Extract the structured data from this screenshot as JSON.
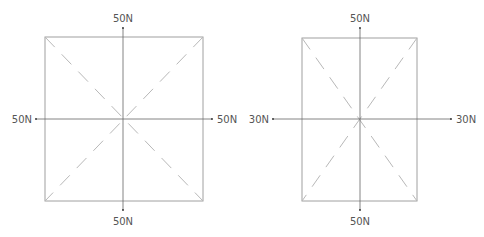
{
  "diagrams": [
    {
      "name": "square-plate",
      "box": {
        "x": 45,
        "y": 37,
        "w": 158,
        "h": 164
      },
      "center": {
        "x": 123,
        "y": 119
      },
      "forces": {
        "top": "50N",
        "bottom": "50N",
        "left": "50N",
        "right": "50N"
      }
    },
    {
      "name": "rectangular-plate",
      "box": {
        "x": 302,
        "y": 38,
        "w": 115,
        "h": 163
      },
      "center": {
        "x": 360,
        "y": 119
      },
      "forces": {
        "top": "50N",
        "bottom": "50N",
        "left": "30N",
        "right": "30N"
      }
    }
  ],
  "colors": {
    "box": "#9a9a9a",
    "axis": "#555555",
    "dash": "#b0b0b0",
    "label": "#555555"
  }
}
